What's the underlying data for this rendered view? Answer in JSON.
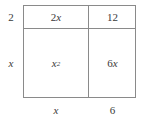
{
  "figure": {
    "name": "area-model-rectangle",
    "line_color": "#8a8a8a",
    "text_color": "#3a3a3a",
    "background_color": "#ffffff"
  },
  "dimension_labels": {
    "left_top": "2",
    "left_bottom": "x",
    "bottom_left": "x",
    "bottom_right": "6"
  },
  "cells": {
    "top_left": {
      "base": "2",
      "variable": "x",
      "exponent": ""
    },
    "top_right": {
      "base": "12",
      "variable": "",
      "exponent": ""
    },
    "bottom_left": {
      "base": "",
      "variable": "x",
      "exponent": "2"
    },
    "bottom_right": {
      "base": "6",
      "variable": "x",
      "exponent": ""
    }
  },
  "chart_data": {
    "type": "table",
    "title": "",
    "row_headers": [
      "2",
      "x"
    ],
    "column_headers": [
      "x",
      "6"
    ],
    "cells": [
      [
        "2x",
        "12"
      ],
      [
        "x^2",
        "6x"
      ]
    ]
  }
}
